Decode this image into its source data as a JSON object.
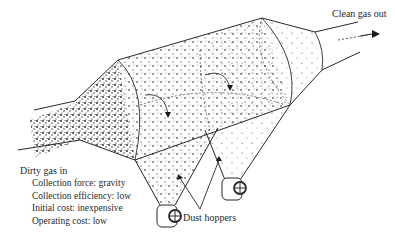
{
  "diagram": {
    "type": "settling chamber (gravity dust collector)",
    "labels": {
      "outlet": "Clean gas out",
      "inlet": "Dirty gas in",
      "hoppers": "Dust hoppers"
    },
    "properties": [
      {
        "text": "Collection force: gravity"
      },
      {
        "text": "Collection efficiency: low"
      },
      {
        "text": "Initial cost: inexpensive"
      },
      {
        "text": "Operating cost: low"
      }
    ],
    "colors": {
      "line": "#2a2a2a",
      "particles": "#1a1a1a",
      "background": "#ffffff"
    }
  }
}
